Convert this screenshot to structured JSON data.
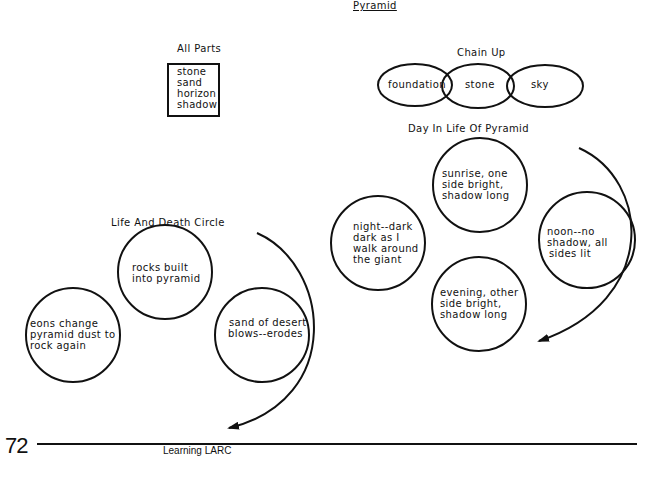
{
  "page": {
    "title": "Pyramid",
    "page_number": "72",
    "footer_text": "Learning LARC"
  },
  "all_parts": {
    "title": "All Parts",
    "items": [
      "stone",
      "sand",
      "horizon",
      "shadow"
    ]
  },
  "chain_up": {
    "title": "Chain Up",
    "links": [
      "foundation",
      "stone",
      "sky"
    ]
  },
  "day_in_life": {
    "title": "Day In Life Of Pyramid",
    "stages": [
      {
        "lines": [
          "sunrise, one",
          "side bright,",
          "shadow long"
        ]
      },
      {
        "lines": [
          "noon--no",
          "shadow, all",
          "sides lit"
        ]
      },
      {
        "lines": [
          "evening, other",
          "side bright,",
          "shadow long"
        ]
      },
      {
        "lines": [
          "night--dark",
          "dark as I",
          "walk around",
          "the giant"
        ]
      }
    ]
  },
  "life_and_death": {
    "title": "Life And Death Circle",
    "stages": [
      {
        "lines": [
          "rocks built",
          "into pyramid"
        ]
      },
      {
        "lines": [
          "sand of desert",
          "blows--erodes"
        ]
      },
      {
        "lines": [
          "eons change",
          "pyramid dust to",
          "rock again"
        ]
      }
    ]
  },
  "colors": {
    "ink": "#111111",
    "background": "#ffffff"
  }
}
